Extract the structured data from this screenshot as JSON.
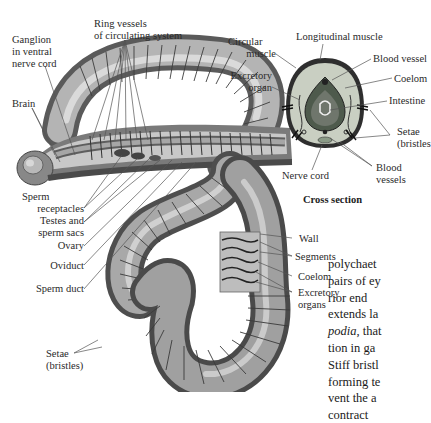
{
  "figure": {
    "worm_labels_left": {
      "ganglion": [
        "Ganglion",
        "in ventral",
        "nerve cord"
      ],
      "ring_vessels": [
        "Ring vessels",
        "of circulating system"
      ],
      "brain": "Brain",
      "sperm_receptacles": [
        "Sperm",
        "receptacles"
      ],
      "testes": [
        "Testes and",
        "sperm sacs"
      ],
      "ovary": "Ovary",
      "oviduct": "Oviduct",
      "sperm_duct": "Sperm duct",
      "setae": [
        "Setae",
        "(bristles)"
      ]
    },
    "worm_labels_right": {
      "wall": "Wall",
      "segments": "Segments",
      "coelom": "Coelom",
      "excretory": [
        "Excretory",
        "organs"
      ]
    },
    "cross_section": {
      "caption": "Cross section",
      "labels": {
        "circular_muscle": [
          "Circular",
          "muscle"
        ],
        "longitudinal_muscle": "Longitudinal muscle",
        "blood_vessel": "Blood vessel",
        "excretory_organ": [
          "Excretory",
          "organ"
        ],
        "coelom": "Coelom",
        "intestine": "Intestine",
        "setae": [
          "Setae",
          "(bristles"
        ],
        "nerve_cord": "Nerve cord",
        "blood_vessels": [
          "Blood",
          "vessels"
        ]
      }
    },
    "colors": {
      "worm_body": "#8c8c8c",
      "worm_highlight": "#d9d9d9",
      "cross_section_fill": "#c9cfc2",
      "intestine_fill": "#6f766c",
      "leader_lines": "#555555"
    }
  },
  "body_text": {
    "lines": [
      "polychaet",
      "pairs of ey",
      "rior end ",
      "extends la",
      "podia, that",
      "tion in ga",
      "Stiff bristl",
      "forming te",
      "vent the a",
      "contract"
    ],
    "italic_word": "podia"
  }
}
